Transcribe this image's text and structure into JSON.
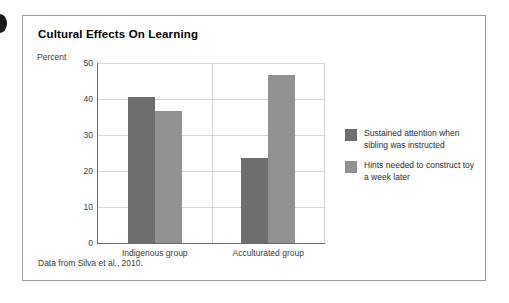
{
  "figure": {
    "marker": "figure-bullet",
    "source_note": "Data from Silva et al., 2010."
  },
  "chart_data": {
    "type": "bar",
    "title": "Cultural Effects On Learning",
    "xlabel": "",
    "ylabel": "Percent",
    "ylim": [
      0,
      50
    ],
    "yticks": [
      0,
      10,
      20,
      30,
      40,
      50
    ],
    "ytick_labels": [
      "0",
      "10",
      "20",
      "30",
      "40",
      "50"
    ],
    "grid": true,
    "legend_position": "right",
    "categories": [
      "Indigenous group",
      "Acculturated group"
    ],
    "series": [
      {
        "name": "Sustained attention when sibling was instructed",
        "color": "#6e6e6e",
        "values": [
          40.5,
          23.5
        ]
      },
      {
        "name": "Hints needed to construct toy a week later",
        "color": "#919191",
        "values": [
          36.8,
          46.8
        ]
      }
    ]
  }
}
